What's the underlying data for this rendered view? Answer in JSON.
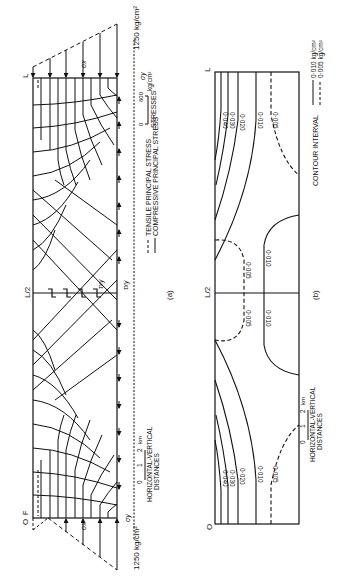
{
  "figure": {
    "panel_a": {
      "caption": "(a)",
      "top_marker": "L",
      "bottom_marker": "O",
      "bottom_marker_sub": "F",
      "midspan_label": "L/2",
      "sigma_x_top": "σx",
      "sigma_x_bottom": "σx",
      "sigma_y_top": "σy",
      "sigma_y_bottom": "σy",
      "tau_xy_inner": "τxy",
      "tau_xy_outer": "τxy",
      "load_top": "1250 kg/cm²",
      "load_bottom": "1250 kg/cm²",
      "stress_scale": {
        "label": "STRESSES",
        "tick_0": "0",
        "tick_600": "600",
        "unit": "kg/cm²"
      },
      "legend": {
        "tensile": "TENSILE PRINCIPAL STRESS",
        "compressive": "COMPRESSIVE PRINCIPAL STRESS"
      },
      "distance_scale": {
        "tick_0": "0",
        "tick_1": "1",
        "tick_2": "2",
        "unit": "km",
        "label_1": "HORIZONTAL-VERTICAL",
        "label_2": "DISTANCES"
      }
    },
    "panel_b": {
      "caption": "(b)",
      "top_marker": "L",
      "bottom_marker": "O",
      "midspan_label": "L/2",
      "contours_top": [
        "0·040",
        "0·030",
        "0·020",
        "0·010",
        "0·005"
      ],
      "contours_bottom": [
        "0·040",
        "0·030",
        "0·020",
        "0·010",
        "0·005"
      ],
      "contours_mid": [
        "0·005",
        "0·005",
        "0·010",
        "0·010"
      ],
      "contour_interval": {
        "label": "CONTOUR INTERVAL",
        "solid": "0·010 kg/cm²",
        "dashed": "0·005 kg/cm²"
      },
      "distance_scale": {
        "tick_0": "0",
        "tick_1": "1",
        "tick_2": "2",
        "unit": "km",
        "label_1": "HORIZONTAL-VERTICAL",
        "label_2": "DISTANCES"
      }
    }
  }
}
